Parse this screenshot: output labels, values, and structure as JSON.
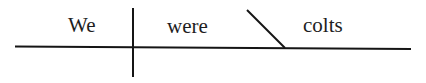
{
  "diagram": {
    "type": "sentence-diagram",
    "sentence": "We were colts",
    "line_color": "#151515",
    "text_color": "#1e1e1e",
    "parts": {
      "subject": {
        "label": "We",
        "role": "subject"
      },
      "verb": {
        "label": "were",
        "role": "linking-verb"
      },
      "complement": {
        "label": "colts",
        "role": "predicate-nominative"
      }
    },
    "separators": [
      {
        "kind": "subject-predicate divider",
        "style": "vertical line crossing baseline"
      },
      {
        "kind": "complement divider",
        "style": "slanted line toward subject"
      }
    ]
  }
}
